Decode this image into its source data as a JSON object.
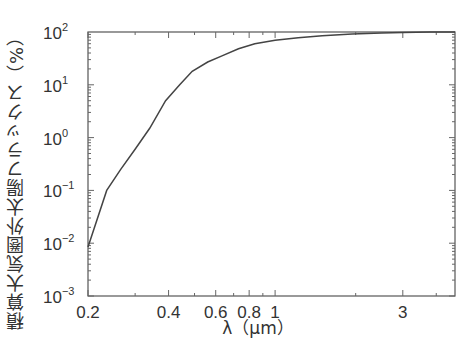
{
  "chart_data": {
    "type": "line",
    "title": "",
    "xlabel": "λ（μm）",
    "ylabel": "積算大気圏外太陽フラックス（%）",
    "x_scale": "log",
    "y_scale": "log",
    "xlim": [
      0.2,
      4.7
    ],
    "ylim": [
      0.001,
      100
    ],
    "x_ticks": [
      {
        "value": 0.2,
        "label": "0.2"
      },
      {
        "value": 0.4,
        "label": "0.4"
      },
      {
        "value": 0.6,
        "label": "0.6"
      },
      {
        "value": 0.8,
        "label": "0.8"
      },
      {
        "value": 1,
        "label": "1"
      },
      {
        "value": 3,
        "label": "3"
      }
    ],
    "y_ticks": [
      {
        "value": 100,
        "base": "10",
        "exp": "2"
      },
      {
        "value": 10,
        "base": "10",
        "exp": "1"
      },
      {
        "value": 1,
        "base": "10",
        "exp": "0"
      },
      {
        "value": 0.1,
        "base": "10",
        "exp": "−1"
      },
      {
        "value": 0.01,
        "base": "10",
        "exp": "−2"
      },
      {
        "value": 0.001,
        "base": "10",
        "exp": "−3"
      }
    ],
    "grid": false,
    "legend": null,
    "series": [
      {
        "name": "積算大気圏外太陽フラックス",
        "x": [
          0.2,
          0.235,
          0.265,
          0.3,
          0.34,
          0.39,
          0.44,
          0.49,
          0.56,
          0.63,
          0.73,
          0.84,
          1.0,
          1.22,
          1.5,
          1.94,
          2.5,
          3.0,
          3.8,
          4.7
        ],
        "y": [
          0.0085,
          0.1,
          0.25,
          0.6,
          1.5,
          5.0,
          10,
          18,
          27,
          35,
          48,
          60,
          70,
          78,
          85,
          92,
          96,
          98,
          99.5,
          100
        ]
      }
    ]
  }
}
